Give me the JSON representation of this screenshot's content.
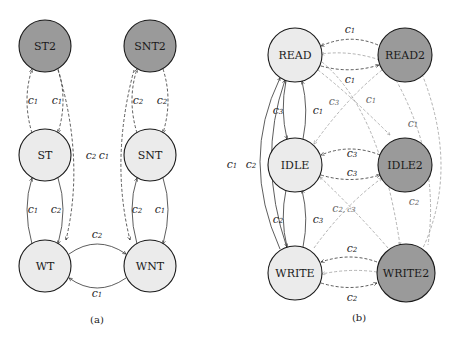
{
  "colors": {
    "node_light": "#ebebeb",
    "node_dark": "#9a9a9a",
    "stroke": "#1a1a1a",
    "edge_light": "#a0a0a0"
  },
  "diagram_a": {
    "caption": "(a)",
    "nodes": [
      {
        "id": "ST2",
        "label": "ST2",
        "shade": "dark"
      },
      {
        "id": "SNT2",
        "label": "SNT2",
        "shade": "dark"
      },
      {
        "id": "ST",
        "label": "ST",
        "shade": "light"
      },
      {
        "id": "SNT",
        "label": "SNT",
        "shade": "light"
      },
      {
        "id": "WT",
        "label": "WT",
        "shade": "light"
      },
      {
        "id": "WNT",
        "label": "WNT",
        "shade": "light"
      }
    ],
    "edge_labels": {
      "st_st2_left": "c",
      "st_st2_left_sub": "1",
      "st_st2_right": "c",
      "st_st2_right_sub": "1",
      "snt_snt2_left": "c",
      "snt_snt2_left_sub": "2",
      "snt_snt2_right": "c",
      "snt_snt2_right_sub": "2",
      "cross_a": "c",
      "cross_a_sub": "2",
      "cross_b": "c",
      "cross_b_sub": "1",
      "wt_st": "c",
      "wt_st_sub": "1",
      "st_wt": "c",
      "st_wt_sub": "2",
      "snt_wnt_left": "c",
      "snt_wnt_left_sub": "2",
      "snt_wnt_right": "c",
      "snt_wnt_right_sub": "1",
      "wt_wnt": "c",
      "wt_wnt_sub": "2",
      "wnt_wt": "c",
      "wnt_wt_sub": "1"
    }
  },
  "diagram_b": {
    "caption": "(b)",
    "nodes": [
      {
        "id": "READ",
        "label": "READ",
        "shade": "light"
      },
      {
        "id": "READ2",
        "label": "READ2",
        "shade": "dark"
      },
      {
        "id": "IDLE",
        "label": "IDLE",
        "shade": "light"
      },
      {
        "id": "IDLE2",
        "label": "IDLE2",
        "shade": "dark"
      },
      {
        "id": "WRITE",
        "label": "WRITE",
        "shade": "light"
      },
      {
        "id": "WRITE2",
        "label": "WRITE2",
        "shade": "dark"
      }
    ],
    "edge_labels": {
      "read2_read_top": "c",
      "read2_read_top_sub": "1",
      "read_read2_mid": "c",
      "read_read2_mid_sub": "1",
      "idle_read2": "c",
      "idle_read2_sub": "3",
      "read_idle2": "c",
      "read_idle2_sub": "1",
      "read2_write": "c",
      "read2_write_sub": "1",
      "read_idle": "c",
      "read_idle_sub": "3",
      "idle_read": "c",
      "idle_read_sub": "1",
      "write_read_outer": "c",
      "write_read_outer_sub": "1",
      "write_read_inner": "c",
      "write_read_inner_sub": "2",
      "idle2_idle": "c",
      "idle2_idle_sub": "3",
      "idle_idle2": "c",
      "idle_idle2_sub": "3",
      "write_idle2": "c",
      "write_idle2_sub": "2, c",
      "write_idle2_sub2": "3",
      "idle2_write_right": "c",
      "idle2_write_right_sub": "2",
      "idle_write": "c",
      "idle_write_sub": "2",
      "write_idle": "c",
      "write_idle_sub": "3",
      "write2_write_top": "c",
      "write2_write_top_sub": "2",
      "write_write2_bot": "c",
      "write_write2_bot_sub": "2"
    }
  }
}
